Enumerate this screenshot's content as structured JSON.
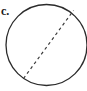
{
  "figure": {
    "label": "c.",
    "background_color": "#ffffff",
    "width": 87,
    "height": 91,
    "stroke_color": "#2b2b2b",
    "dash_color": "#3a3a3a"
  },
  "chart_data": {
    "type": "diagram",
    "title": "c.",
    "shapes": [
      {
        "name": "circle",
        "kind": "circle",
        "cx": 46.5,
        "cy": 45,
        "r": 40.5,
        "stroke": "#2b2b2b",
        "stroke_width": 1.3,
        "fill": "none",
        "dashed": false
      },
      {
        "name": "chord",
        "kind": "line",
        "x1": 23.5,
        "y1": 78.5,
        "x2": 73.5,
        "y2": 10.5,
        "stroke": "#3a3a3a",
        "stroke_width": 1.2,
        "fill": "none",
        "dashed": true,
        "dash_pattern": "3 3"
      }
    ],
    "annotations": [
      {
        "name": "part-label",
        "text": "c.",
        "x": 2,
        "y": 16
      }
    ]
  }
}
